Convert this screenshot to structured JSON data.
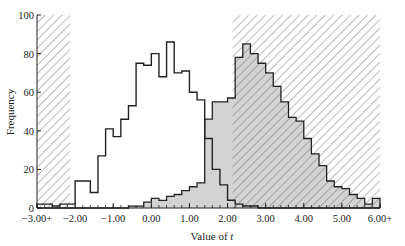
{
  "chart_data": {
    "type": "bar",
    "subtype": "step-histogram",
    "title": "",
    "xlabel": "Value of t",
    "ylabel": "Frequency",
    "xlim": [
      -3.0,
      6.0
    ],
    "ylim": [
      0,
      100
    ],
    "x_tick_labels": [
      "−3.00+",
      "−2.00",
      "−1.00",
      "0.00",
      "1.00",
      "2.00",
      "3.00",
      "4.00",
      "5.00",
      "6.00+"
    ],
    "x_ticks": [
      -3.0,
      -2.0,
      -1.0,
      0.0,
      1.0,
      2.0,
      3.0,
      4.0,
      5.0,
      6.0
    ],
    "y_ticks": [
      0,
      20,
      40,
      60,
      80,
      100
    ],
    "grid": false,
    "bin_start": -3.0,
    "bin_width": 0.2,
    "rejection_regions": [
      {
        "from": -3.0,
        "to": -2.13,
        "style": "hatched"
      },
      {
        "from": 2.13,
        "to": 6.0,
        "style": "hatched"
      }
    ],
    "series": [
      {
        "name": "Null distribution (white)",
        "fill": "none",
        "values": [
          2,
          2,
          1,
          2,
          2,
          14,
          14,
          8,
          27,
          41,
          37,
          46,
          53,
          75,
          74,
          80,
          68,
          86,
          70,
          71,
          60,
          56,
          36,
          20,
          12,
          4,
          2,
          1,
          1,
          0,
          0,
          0,
          0,
          0,
          0,
          0,
          0,
          0,
          0,
          0,
          0,
          0,
          0,
          0,
          0
        ]
      },
      {
        "name": "Alternative distribution (shaded)",
        "fill": "#d3d3d3",
        "values": [
          0,
          0,
          0,
          0,
          0,
          0,
          0,
          0,
          0,
          0,
          0,
          0,
          1,
          1,
          3,
          5,
          4,
          6,
          7,
          9,
          11,
          13,
          46,
          55,
          55,
          57,
          78,
          85,
          80,
          75,
          70,
          63,
          55,
          47,
          45,
          36,
          28,
          22,
          14,
          11,
          10,
          7,
          5,
          2,
          5
        ]
      }
    ]
  },
  "axes": {
    "ylabel": "Frequency",
    "xlabel_prefix": "Value of ",
    "xlabel_var": "t",
    "y_tick_labels": [
      "0",
      "20",
      "40",
      "60",
      "80",
      "100"
    ],
    "x_tick_labels": [
      "−3.00+",
      "−2.00",
      "−1.00",
      "0.00",
      "1.00",
      "2.00",
      "3.00",
      "4.00",
      "5.00",
      "6.00+"
    ]
  },
  "colors": {
    "shaded": "#d3d3d3",
    "line": "#222222",
    "hatch": "#555555"
  }
}
